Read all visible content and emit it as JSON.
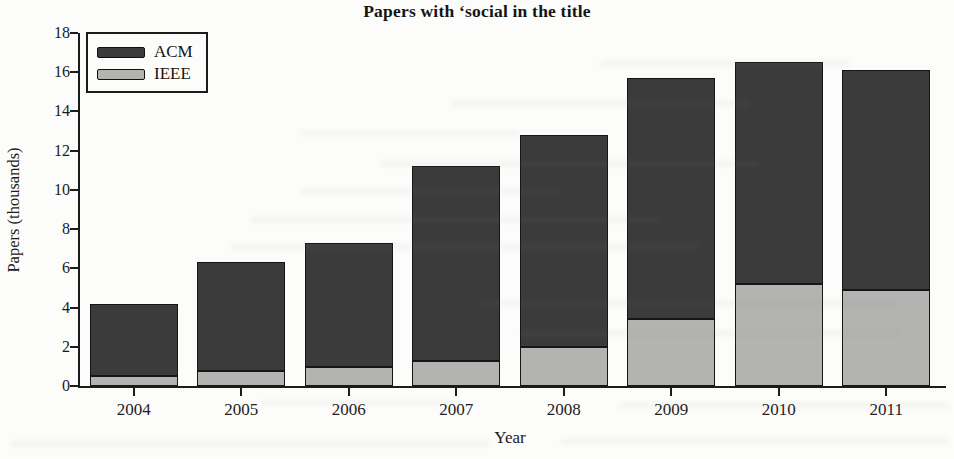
{
  "title": "Papers with ‘social in the title",
  "chart_data": {
    "type": "bar",
    "stacked": true,
    "title": "Papers with ‘social in the title",
    "xlabel": "Year",
    "ylabel": "Papers (thousands)",
    "categories": [
      "2004",
      "2005",
      "2006",
      "2007",
      "2008",
      "2009",
      "2010",
      "2011"
    ],
    "series": [
      {
        "name": "ACM",
        "color": "#3b3b3c",
        "values": [
          3.7,
          5.55,
          6.35,
          9.95,
          10.8,
          12.3,
          11.3,
          11.2
        ]
      },
      {
        "name": "IEEE",
        "color": "#b3b3b2",
        "values": [
          0.5,
          0.75,
          0.95,
          1.25,
          2.0,
          3.4,
          5.2,
          4.9
        ]
      }
    ],
    "stack_totals": [
      4.2,
      6.3,
      7.3,
      11.2,
      12.8,
      15.7,
      16.5,
      16.1
    ],
    "ylim": [
      0,
      18
    ],
    "ytick_step": 2,
    "ytick_labels": [
      "0",
      "2",
      "4",
      "6",
      "8",
      "10",
      "12",
      "14",
      "16",
      "18"
    ],
    "grid": false,
    "legend_position": "top-left",
    "bar_border_color": "#161616",
    "axis_color": "#1c1c1c"
  }
}
